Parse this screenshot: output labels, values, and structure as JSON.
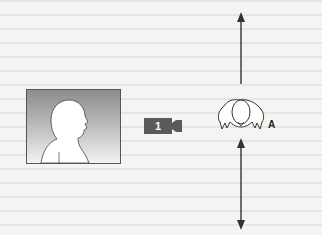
{
  "diagram": {
    "type": "camera-blocking",
    "frame_preview": {
      "subject": "profile-silhouette",
      "facing": "right"
    },
    "camera": {
      "number": "1",
      "color": "#5a5a5a"
    },
    "subject": {
      "label": "A",
      "view": "top-down"
    },
    "movement": {
      "direction": "vertical",
      "arrows": [
        "up",
        "down-both"
      ]
    }
  }
}
